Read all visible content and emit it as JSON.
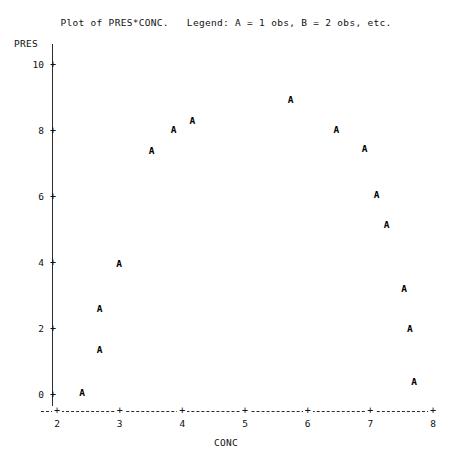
{
  "chart_data": {
    "type": "scatter",
    "title": "Plot of PRES*CONC.   Legend: A = 1 obs, B = 2 obs, etc.",
    "xlabel": "CONC",
    "ylabel": "PRES",
    "xlim": [
      2,
      8
    ],
    "ylim": [
      0,
      10
    ],
    "xticks": [
      2,
      3,
      4,
      5,
      6,
      7,
      8
    ],
    "xtick_labels": [
      "2",
      "3",
      "4",
      "5",
      "6",
      "7",
      "8"
    ],
    "yticks": [
      0,
      2,
      4,
      6,
      8,
      10
    ],
    "ytick_labels": [
      "0",
      "2",
      "4",
      "6",
      "8",
      "10"
    ],
    "grid": false,
    "legend": "A = 1 obs, B = 2 obs, etc.",
    "marker_symbol": "A",
    "tick_symbol": "+",
    "x_axis_style": "dashed",
    "y_axis_style": "solid",
    "series": [
      {
        "name": "PRES*CONC",
        "points": [
          {
            "x": 2.4,
            "y": 0.06,
            "label": "A"
          },
          {
            "x": 2.68,
            "y": 1.35,
            "label": "A"
          },
          {
            "x": 2.68,
            "y": 2.6,
            "label": "A"
          },
          {
            "x": 2.99,
            "y": 3.97,
            "label": "A"
          },
          {
            "x": 3.51,
            "y": 7.4,
            "label": "A"
          },
          {
            "x": 3.86,
            "y": 8.03,
            "label": "A"
          },
          {
            "x": 4.16,
            "y": 8.3,
            "label": "A"
          },
          {
            "x": 5.73,
            "y": 8.95,
            "label": "A"
          },
          {
            "x": 6.46,
            "y": 8.03,
            "label": "A"
          },
          {
            "x": 6.91,
            "y": 7.45,
            "label": "A"
          },
          {
            "x": 7.1,
            "y": 6.05,
            "label": "A"
          },
          {
            "x": 7.26,
            "y": 5.15,
            "label": "A"
          },
          {
            "x": 7.54,
            "y": 3.2,
            "label": "A"
          },
          {
            "x": 7.63,
            "y": 2.0,
            "label": "A"
          },
          {
            "x": 7.7,
            "y": 0.4,
            "label": "A"
          }
        ]
      }
    ]
  }
}
